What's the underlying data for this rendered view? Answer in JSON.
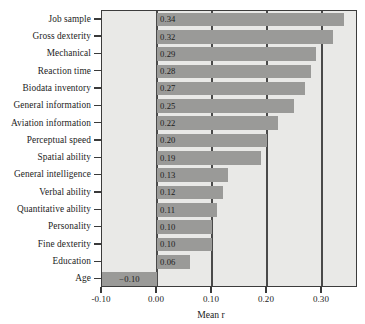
{
  "chart_data": {
    "type": "bar",
    "orientation": "horizontal",
    "title": "",
    "xlabel": "Mean r",
    "ylabel": "",
    "xlim": [
      -0.1,
      0.3655
    ],
    "xticks": [
      -0.1,
      0.0,
      0.1,
      0.2,
      0.3
    ],
    "xtick_labels": [
      "-0.10",
      "0.00",
      "0.10",
      "0.20",
      "0.30"
    ],
    "gridlines": [
      0.0,
      0.1,
      0.2,
      0.3
    ],
    "grid": true,
    "legend": "none",
    "categories": [
      "Job sample",
      "Gross dexterity",
      "Mechanical",
      "Reaction time",
      "Biodata inventory",
      "General information",
      "Aviation information",
      "Perceptual speed",
      "Spatial ability",
      "General intelligence",
      "Verbal ability",
      "Quantitative ability",
      "Personality",
      "Fine dexterity",
      "Education",
      "Age"
    ],
    "values": [
      0.34,
      0.32,
      0.29,
      0.28,
      0.27,
      0.25,
      0.22,
      0.2,
      0.19,
      0.13,
      0.12,
      0.11,
      0.1,
      0.1,
      0.06,
      -0.1
    ],
    "value_labels": [
      "0.34",
      "0.32",
      "0.29",
      "0.28",
      "0.27",
      "0.25",
      "0.22",
      "0.20",
      "0.19",
      "0.13",
      "0.12",
      "0.11",
      "0.10",
      "0.10",
      "0.06",
      "−0.10"
    ],
    "bar_color": "#9a9a98",
    "plot_background": "#e9e9e7",
    "axis_color": "#3c3c3c",
    "label_color": "#1b1b1b"
  }
}
